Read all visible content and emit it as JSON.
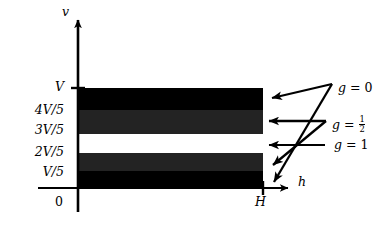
{
  "figure": {
    "kind": "axis-diagram",
    "axes": {
      "vertical_axis_label": "v",
      "horizontal_axis_label": "h",
      "origin_label": "0",
      "x_max_label": "H",
      "y_max_label": "V"
    },
    "y_ticks": [
      {
        "label": "V",
        "value": "V"
      },
      {
        "label": "4V/5",
        "value": "4V/5"
      },
      {
        "label": "3V/5",
        "value": "3V/5"
      },
      {
        "label": "2V/5",
        "value": "2V/5"
      },
      {
        "label": "V/5",
        "value": "V/5"
      }
    ],
    "bands": [
      {
        "id": "band-top-black",
        "from": "4V/5",
        "to": "V",
        "fill": "#000000",
        "g": "0"
      },
      {
        "id": "band-upper-gray",
        "from": "3V/5",
        "to": "4V/5",
        "fill": "#232323",
        "g": "1/2"
      },
      {
        "id": "band-middle-white",
        "from": "2V/5",
        "to": "3V/5",
        "fill": "#ffffff",
        "g": "1"
      },
      {
        "id": "band-lower-gray",
        "from": "V/5",
        "to": "2V/5",
        "fill": "#232323",
        "g": "1/2"
      },
      {
        "id": "band-bottom-black",
        "from": "0",
        "to": "V/5",
        "fill": "#000000",
        "g": "0"
      }
    ],
    "annotations": [
      {
        "id": "g-zero",
        "text_prefix": "g = ",
        "value": "0",
        "is_fraction": false
      },
      {
        "id": "g-one-half",
        "text_prefix": "g = ",
        "value": "1/2",
        "is_fraction": true,
        "numerator": "1",
        "denominator": "2"
      },
      {
        "id": "g-one",
        "text_prefix": "g = ",
        "value": "1",
        "is_fraction": false
      }
    ],
    "colors": {
      "ink": "#000000",
      "paper": "#ffffff",
      "gray_band": "#232323"
    }
  }
}
